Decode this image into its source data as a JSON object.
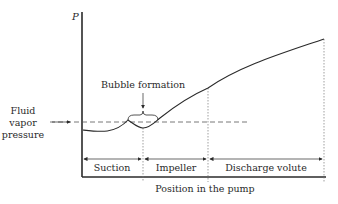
{
  "diagram": {
    "y_axis_label": "P",
    "x_axis_label": "Position in the pump",
    "annotations": {
      "bubble": "Bubble formation",
      "vapor_line": [
        "Fluid",
        "vapor",
        "pressure"
      ]
    },
    "regions": [
      {
        "label": "Suction"
      },
      {
        "label": "Impeller"
      },
      {
        "label": "Discharge volute"
      }
    ],
    "colors": {
      "line": "#2a2a2a",
      "dashed": "#555555",
      "background": "#ffffff"
    }
  }
}
